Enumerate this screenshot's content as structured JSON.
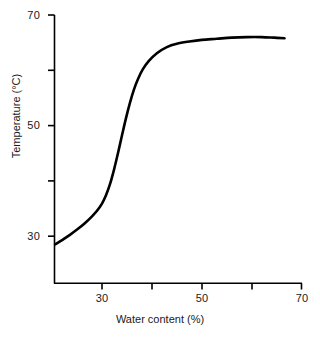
{
  "chart_data": {
    "type": "line",
    "title": "",
    "xlabel": "Water content (%)",
    "ylabel": "Temperature (°C)",
    "xlim": [
      20.6,
      70
    ],
    "ylim": [
      22,
      70
    ],
    "grid": false,
    "legend": "none",
    "xticks": [
      {
        "value": 30,
        "label": "30"
      },
      {
        "value": 40,
        "label": ""
      },
      {
        "value": 50,
        "label": "50"
      },
      {
        "value": 60,
        "label": ""
      },
      {
        "value": 70,
        "label": "70"
      }
    ],
    "yticks": [
      {
        "value": 30,
        "label": "30"
      },
      {
        "value": 40,
        "label": ""
      },
      {
        "value": 50,
        "label": "50"
      },
      {
        "value": 60,
        "label": ""
      },
      {
        "value": 70,
        "label": "70"
      }
    ],
    "series": [
      {
        "name": "gelatinisation curve",
        "color": "#000000",
        "linewidth": 2.6,
        "x": [
          20.6,
          22.0,
          23.5,
          25.0,
          26.5,
          28.0,
          29.0,
          30.0,
          30.8,
          31.6,
          32.4,
          33.2,
          34.0,
          34.8,
          35.6,
          36.4,
          37.2,
          38.2,
          39.4,
          41.0,
          43.0,
          45.0,
          47.5,
          50.0,
          53.0,
          56.0,
          59.0,
          62.0,
          64.5,
          66.6
        ],
        "y": [
          28.5,
          29.3,
          30.2,
          31.2,
          32.3,
          33.6,
          34.6,
          35.9,
          37.4,
          39.4,
          42.0,
          45.0,
          48.2,
          51.3,
          54.1,
          56.5,
          58.4,
          60.2,
          61.7,
          63.1,
          64.2,
          64.8,
          65.2,
          65.5,
          65.7,
          65.9,
          66.0,
          66.0,
          65.9,
          65.8
        ]
      }
    ]
  },
  "axis": {
    "y_title": "Temperature (°C)",
    "x_title": "Water content (%)",
    "y_tick_labels": [
      "70",
      "",
      "50",
      "",
      "30"
    ],
    "x_tick_labels": [
      "30",
      "",
      "50",
      "",
      "70"
    ]
  }
}
